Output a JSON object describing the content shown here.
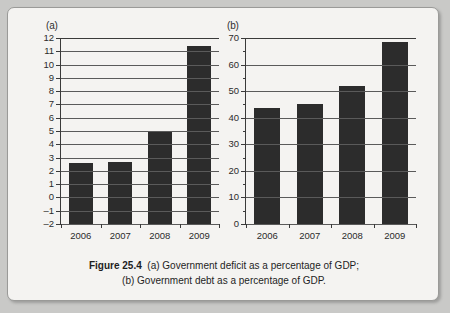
{
  "figure": {
    "caption_bold": "Figure 25.4",
    "caption_line1": "(a) Government deficit as a percentage of GDP;",
    "caption_line2": "(b) Government debt as a percentage of GDP."
  },
  "panel_a": {
    "label": "(a)",
    "ylabels": [
      "12",
      "11",
      "10",
      "9",
      "8",
      "7",
      "6",
      "5",
      "4",
      "3",
      "2",
      "1",
      "0",
      "–1",
      "–2"
    ],
    "xlabels": [
      "2006",
      "2007",
      "2008",
      "2009"
    ]
  },
  "panel_b": {
    "label": "(b)",
    "ylabels": [
      "70",
      "60",
      "50",
      "40",
      "30",
      "20",
      "10",
      "0"
    ],
    "xlabels": [
      "2006",
      "2007",
      "2008",
      "2009"
    ]
  },
  "chart_data": [
    {
      "type": "bar",
      "panel": "(a)",
      "title": "Government deficit as a percentage of GDP",
      "categories": [
        "2006",
        "2007",
        "2008",
        "2009"
      ],
      "values": [
        2.6,
        2.7,
        4.95,
        11.4
      ],
      "xlabel": "",
      "ylabel": "",
      "ylim": [
        -2,
        12
      ],
      "ytick_step": 1,
      "yticks": [
        -2,
        -1,
        0,
        1,
        2,
        3,
        4,
        5,
        6,
        7,
        8,
        9,
        10,
        11,
        12
      ],
      "grid": true,
      "legend": null,
      "bar_color": "#2c2c2c"
    },
    {
      "type": "bar",
      "panel": "(b)",
      "title": "Government debt as a percentage of GDP",
      "categories": [
        "2006",
        "2007",
        "2008",
        "2009"
      ],
      "values": [
        43.5,
        45.0,
        52.0,
        68.5
      ],
      "xlabel": "",
      "ylabel": "",
      "ylim": [
        0,
        70
      ],
      "ytick_step": 10,
      "yticks": [
        0,
        10,
        20,
        30,
        40,
        50,
        60,
        70
      ],
      "minor_tick_step": 5,
      "grid": true,
      "legend": null,
      "bar_color": "#2c2c2c"
    }
  ]
}
